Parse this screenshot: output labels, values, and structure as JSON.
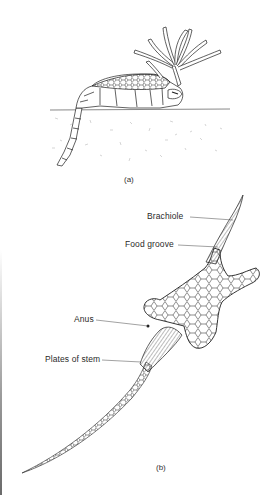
{
  "figure": {
    "panels": [
      {
        "id": "a",
        "caption": "(a)",
        "subject": "Cystoid echinoderm in life position, brachioles raised, stem partly buried in sediment"
      },
      {
        "id": "b",
        "caption": "(b)",
        "subject": "Cystoid echinoderm theca with labelled structures"
      }
    ],
    "labels": {
      "brachiole": "Brachiole",
      "food_groove": "Food groove",
      "anus": "Anus",
      "plates_of_stem": "Plates of stem"
    },
    "colors": {
      "ink": "#1e1e1e",
      "background": "#ffffff",
      "sediment_speckle": "#b8b8b8"
    }
  }
}
